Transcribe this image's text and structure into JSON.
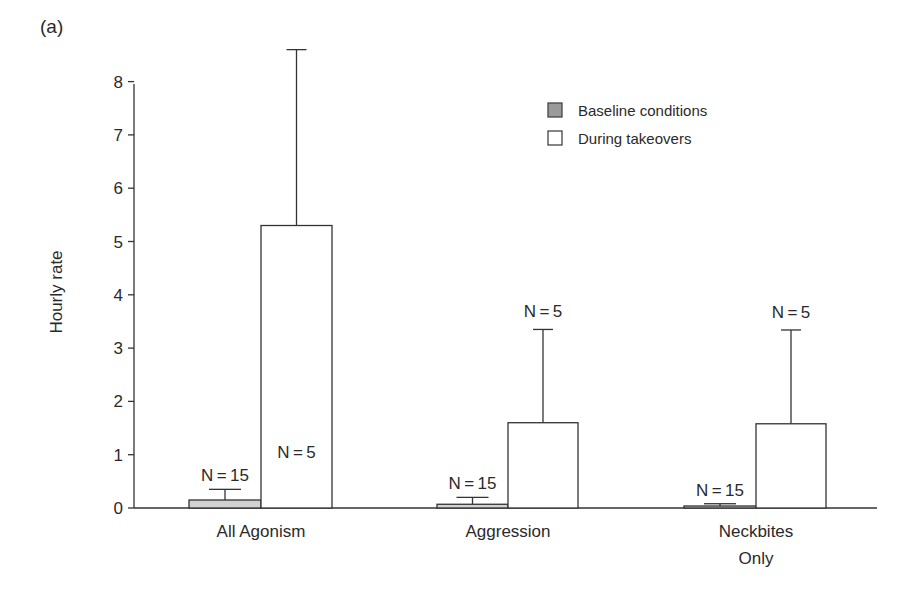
{
  "panel_label": "(a)",
  "chart_data": {
    "type": "bar",
    "title": "",
    "panel": "(a)",
    "xlabel": "",
    "ylabel": "Hourly rate",
    "ylim": [
      0,
      8
    ],
    "yticks": [
      0,
      1,
      2,
      3,
      4,
      5,
      6,
      7,
      8
    ],
    "grid": false,
    "legend_position": "upper right",
    "categories": [
      "All Agonism",
      "Aggression",
      "Neckbites Only"
    ],
    "category_label_lines": [
      [
        "All Agonism"
      ],
      [
        "Aggression"
      ],
      [
        "Neckbites",
        "Only"
      ]
    ],
    "series": [
      {
        "name": "Baseline conditions",
        "color": "#d2d2d2",
        "legend_color": "#9a9a9a",
        "values": [
          0.15,
          0.07,
          0.02
        ],
        "error_upper": [
          0.35,
          0.2,
          0.08
        ],
        "n_labels": [
          "N=15",
          "N=15",
          "N=15"
        ]
      },
      {
        "name": "During takeovers",
        "color": "#ffffff",
        "legend_color": "#ffffff",
        "values": [
          5.3,
          1.6,
          1.58
        ],
        "error_upper": [
          8.6,
          3.35,
          3.34
        ],
        "n_labels": [
          "N=5",
          "N=5",
          "N=5"
        ]
      }
    ]
  }
}
